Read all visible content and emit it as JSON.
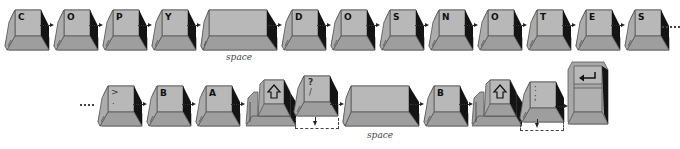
{
  "colors": {
    "key_top": "#b4b4b4",
    "key_side_light": "#a3a3a3",
    "key_front": "#9c9c9c",
    "key_shadow": "#111111",
    "outline": "#444444",
    "background": "#ffffff"
  },
  "row1": {
    "description": "COPY DOS NOTES",
    "keys": [
      {
        "label": "C"
      },
      {
        "label": "O"
      },
      {
        "label": "P"
      },
      {
        "label": "Y"
      },
      {
        "label": "",
        "caption": "space"
      },
      {
        "label": "D"
      },
      {
        "label": "O"
      },
      {
        "label": "S"
      },
      {
        "label": "N"
      },
      {
        "label": "O"
      },
      {
        "label": "T"
      },
      {
        "label": "E"
      },
      {
        "label": "S"
      }
    ],
    "continuation": "..."
  },
  "row2": {
    "continuation": "...",
    "keys": [
      {
        "label": ">",
        "sublabel": "."
      },
      {
        "label": "B"
      },
      {
        "label": "A"
      },
      {
        "label": "shift",
        "icon": "shift-arrow-icon"
      },
      {
        "label": "?",
        "sublabel": "/"
      },
      {
        "label": "",
        "caption": "space"
      },
      {
        "label": "B"
      },
      {
        "label": "shift",
        "icon": "shift-arrow-icon"
      },
      {
        "label": ":",
        "sublabel": ";"
      },
      {
        "label": "return",
        "icon": "return-arrow-icon"
      }
    ]
  }
}
